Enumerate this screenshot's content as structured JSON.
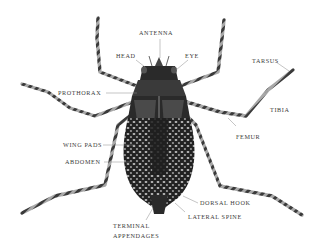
{
  "diagram": {
    "colors": {
      "background": "#ffffff",
      "body_dark": "#1e1e1e",
      "body_mid": "#5a5a5a",
      "body_light": "#c8c8c8",
      "label_text": "#3a3a3a",
      "leader_line": "#8a8a8a"
    },
    "labels": {
      "antenna": "ANTENNA",
      "head": "HEAD",
      "eye": "EYE",
      "prothorax": "PROTHORAX",
      "tarsus": "TARSUS",
      "tibia": "TIBIA",
      "femur": "FEMUR",
      "wing_pads": "WING PADS",
      "abdomen": "ABDOMEN",
      "dorsal_hook": "DORSAL HOOK",
      "lateral_spine": "LATERAL SPINE",
      "terminal_line1": "TERMINAL",
      "terminal_line2": "APPENDAGES"
    }
  }
}
